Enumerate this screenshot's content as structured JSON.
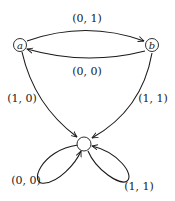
{
  "diagram": {
    "type": "state-graph",
    "nodes": [
      {
        "id": "a",
        "label": "a"
      },
      {
        "id": "b",
        "label": "b"
      },
      {
        "id": "c",
        "label": ""
      }
    ],
    "edges": [
      {
        "from": "a",
        "to": "b",
        "label": "(0, 1)"
      },
      {
        "from": "b",
        "to": "a",
        "label": "(0, 0)"
      },
      {
        "from": "a",
        "to": "c",
        "label": "(1, 0)"
      },
      {
        "from": "b",
        "to": "c",
        "label": "(1, 1)"
      },
      {
        "from": "c",
        "to": "c",
        "label": "(0, 0)"
      },
      {
        "from": "c",
        "to": "c",
        "label": "(1, 1)"
      }
    ]
  }
}
